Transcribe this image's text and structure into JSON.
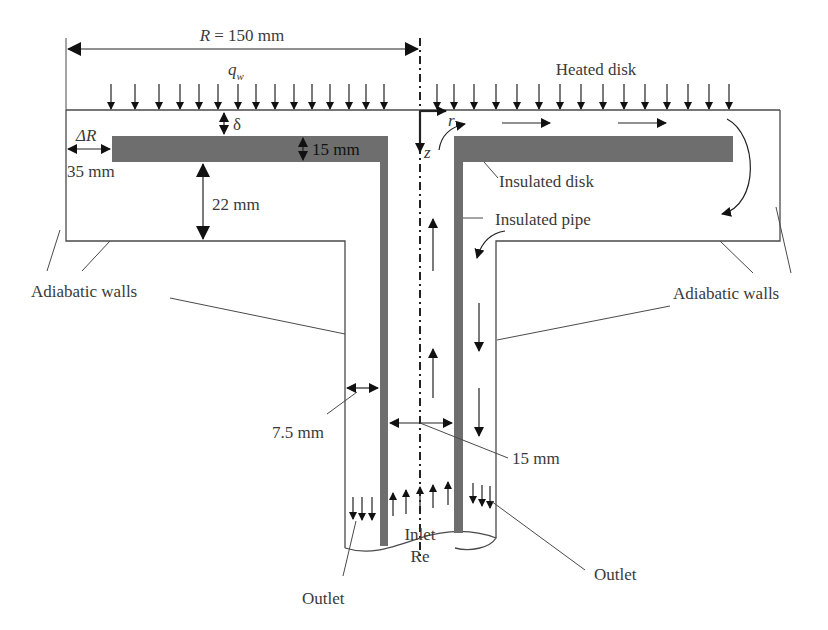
{
  "figure": {
    "colors": {
      "background": "#ffffff",
      "lines": "#4a4a4a",
      "insulation": "#6e6e6e",
      "text": "#3a3a3a"
    }
  },
  "labels": {
    "radius": "R = 150 mm",
    "radius_symbol": "R",
    "radius_value": "= 150 mm",
    "heat_flux_symbol": "q",
    "heat_flux_subscript": "w",
    "heated_disk": "Heated disk",
    "gap_symbol": "δ",
    "delta_r": "ΔR",
    "delta_r_value": "35 mm",
    "disk_thickness": "15 mm",
    "cavity_height": "22 mm",
    "insulated_disk": "Insulated disk",
    "insulated_pipe": "Insulated pipe",
    "adiabatic_walls_left": "Adiabatic walls",
    "adiabatic_walls_right": "Adiabatic walls",
    "annulus_width": "7.5 mm",
    "pipe_radius": "15 mm",
    "inlet": "Inlet",
    "reynolds": "Re",
    "outlet_left": "Outlet",
    "outlet_right": "Outlet",
    "axis_r": "r",
    "axis_z": "z"
  },
  "dimensions": [
    {
      "name": "R",
      "value": "150 mm"
    },
    {
      "name": "ΔR",
      "value": "35 mm"
    },
    {
      "name": "insulated disk thickness",
      "value": "15 mm"
    },
    {
      "name": "cavity height",
      "value": "22 mm"
    },
    {
      "name": "annulus gap",
      "value": "7.5 mm"
    },
    {
      "name": "pipe inner radius",
      "value": "15 mm"
    },
    {
      "name": "gap",
      "value": "δ"
    }
  ]
}
